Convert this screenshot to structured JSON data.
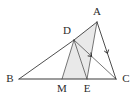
{
  "figure": {
    "kind": "euclidean-geometry-diagram",
    "width": 137,
    "height": 95,
    "background_color": "#ffffff",
    "stroke_color": "#3a3a3a",
    "label_color": "#2b2b2b",
    "shade_color": "#e9e9e9",
    "points": {
      "A": {
        "label": "A",
        "x": 97,
        "y": 22,
        "label_x": 97,
        "label_y": 15
      },
      "B": {
        "label": "B",
        "x": 19,
        "y": 79,
        "label_x": 10,
        "label_y": 82
      },
      "C": {
        "label": "C",
        "x": 116,
        "y": 79,
        "label_x": 126,
        "label_y": 82
      },
      "D": {
        "label": "D",
        "x": 74,
        "y": 40,
        "label_x": 67,
        "label_y": 34
      },
      "E": {
        "label": "E",
        "x": 87,
        "y": 79,
        "label_x": 87,
        "label_y": 92
      },
      "M": {
        "label": "M",
        "x": 62,
        "y": 79,
        "label_x": 62,
        "label_y": 92
      }
    },
    "segments": [
      {
        "name": "segment-BC",
        "from": "B",
        "to": "C",
        "style": "base"
      },
      {
        "name": "segment-BD",
        "from": "B",
        "to": "D",
        "style": "normal"
      },
      {
        "name": "segment-DA",
        "from": "D",
        "to": "A",
        "style": "normal"
      },
      {
        "name": "segment-AC",
        "from": "A",
        "to": "C",
        "style": "normal"
      },
      {
        "name": "segment-DC",
        "from": "D",
        "to": "C",
        "style": "thin"
      },
      {
        "name": "segment-DM",
        "from": "D",
        "to": "M",
        "style": "thin"
      },
      {
        "name": "segment-DE",
        "from": "D",
        "to": "E",
        "style": "thin"
      },
      {
        "name": "segment-AE",
        "from": "A",
        "to": "E",
        "style": "thin"
      }
    ],
    "shaded_regions": [
      {
        "name": "shaded-region-DAE",
        "vertices": [
          "D",
          "A",
          "E"
        ]
      },
      {
        "name": "shaded-region-DME",
        "vertices": [
          "D",
          "M",
          "E"
        ]
      }
    ],
    "parallel_marks": [
      {
        "name": "parallel-mark-on-AC",
        "on_segment": "segment-AC",
        "t": 0.55
      },
      {
        "name": "parallel-mark-on-DC",
        "on_segment": "segment-DC",
        "t": 0.42
      }
    ]
  }
}
